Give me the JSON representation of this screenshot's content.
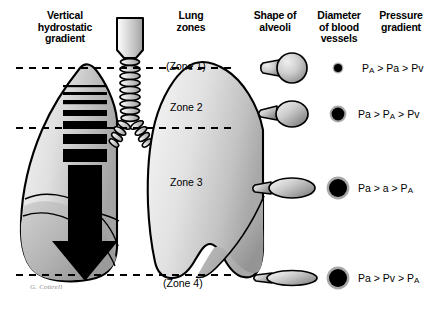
{
  "figure": {
    "signature": "G. Cottrell",
    "background_color": "#ffffff",
    "line_color": "#000000"
  },
  "headers": {
    "vertical_gradient": "Vertical\nhydrostatic\ngradient",
    "vertical_gradient_lines": [
      "Vertical",
      "hydrostatic",
      "gradient"
    ],
    "lung_zones": "Lung\nzones",
    "lung_zones_lines": [
      "Lung",
      "zones"
    ],
    "shape_of_alveoli": "Shape of\nalveoli",
    "shape_of_alveoli_lines": [
      "Shape of",
      "alveoli"
    ],
    "diameter_of_blood_vessels": "Diameter\nof blood\nvessels",
    "diameter_of_blood_vessels_lines": [
      "Diameter",
      "of blood",
      "vessels"
    ],
    "pressure_gradient": "Pressure\ngradient",
    "pressure_gradient_lines": [
      "Pressure",
      "gradient"
    ]
  },
  "zones": [
    {
      "id": "zone-1",
      "label": "(Zone 1)",
      "pressure_gradient_html": "P<span class=\"sub\">A</span> &gt; Pa &gt; Pv",
      "pressure_gradient_text": "PA > Pa > Pv",
      "vessel_diameter_px": 5,
      "alveolus_shape": "round-inflated"
    },
    {
      "id": "zone-2",
      "label": "Zone 2",
      "pressure_gradient_html": "Pa &gt; P<span class=\"sub\">A</span> &gt; Pv",
      "pressure_gradient_text": "Pa > PA > Pv",
      "vessel_diameter_px": 8,
      "alveolus_shape": "round-slightly-flattened"
    },
    {
      "id": "zone-3",
      "label": "Zone 3",
      "pressure_gradient_html": "Pa &gt; a &gt; P<span class=\"sub\">A</span>",
      "pressure_gradient_text": "Pa > a > PA",
      "vessel_diameter_px": 11,
      "alveolus_shape": "oval-flattened"
    },
    {
      "id": "zone-4",
      "label": "(Zone 4)",
      "pressure_gradient_html": "Pa &gt; Pv &gt; P<span class=\"sub\">A</span>",
      "pressure_gradient_text": "Pa > Pv > PA",
      "vessel_diameter_px": 11,
      "alveolus_shape": "ellipse-very-flat"
    }
  ],
  "gradient_bars": {
    "description": "stack of horizontal black bars of increasing thickness feeding a large downward arrow",
    "bar_thicknesses_px": [
      2,
      3,
      4,
      6,
      8,
      10,
      13
    ],
    "arrow_direction": "down"
  },
  "dashed_lines_y": [
    68,
    128,
    275
  ],
  "colors": {
    "lung_fill_light": "#f0f0f0",
    "lung_fill_mid": "#c9c9c9",
    "lung_fill_dark": "#9a9a9a",
    "alveolus_light": "#e8e8e8",
    "alveolus_dark": "#7d7d7d",
    "vessel_ring": "#a8a8a8",
    "vessel_core": "#000000",
    "signature": "#8a8a8a"
  }
}
